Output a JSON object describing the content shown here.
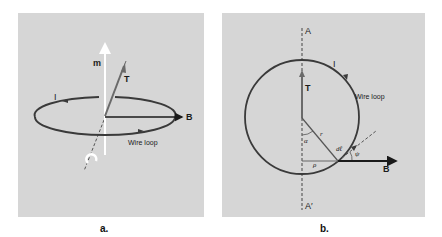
{
  "figure_a": {
    "caption": "a.",
    "labels": {
      "m": "m",
      "T": "T",
      "I": "I",
      "B": "B",
      "wire_loop": "Wire loop"
    }
  },
  "figure_b": {
    "caption": "b.",
    "labels": {
      "A": "A",
      "A_prime": "A′",
      "I": "I",
      "wire_loop": "Wire loop",
      "T": "T",
      "r": "r",
      "alpha": "α",
      "rho": "ρ",
      "dl": "dℓ",
      "psi": "ψ",
      "B": "B"
    }
  },
  "colors": {
    "panel_bg": "#d6d6d6",
    "loop": "#3a3a3a",
    "vector_white": "#ffffff",
    "vector_T": "#6a6a6a",
    "vector_B": "#1a1a1a"
  }
}
